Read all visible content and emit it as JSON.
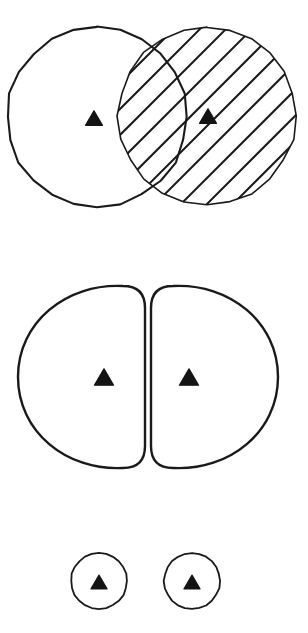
{
  "figure": {
    "background_color": "#ffffff",
    "stroke_color": "#1a1a1a",
    "fill_color": "#ffffff",
    "marker_color": "#141414",
    "width": 308,
    "height": 633,
    "panels": [
      {
        "id": "panel-overlapping-circles",
        "label": "Overlapping circles with hatched right circle",
        "shapes": [
          {
            "name": "left-circle",
            "type": "circle",
            "cx": 97,
            "cy": 117,
            "r": 90,
            "fill": "none",
            "hatched": false,
            "stroke_width": 2.1
          },
          {
            "name": "right-circle",
            "type": "circle",
            "cx": 207,
            "cy": 116,
            "r": 89,
            "fill": "none",
            "hatched": true,
            "hatch_angle_deg": 45,
            "hatch_spacing": 26,
            "hatch_stroke_width": 2.0,
            "stroke_width": 1.6
          }
        ],
        "markers": [
          {
            "name": "left-triangle-marker",
            "type": "triangle-up",
            "cx": 94,
            "cy": 118,
            "size": 17
          },
          {
            "name": "right-triangle-marker",
            "type": "triangle-up",
            "cx": 208,
            "cy": 116,
            "size": 17
          }
        ]
      },
      {
        "id": "panel-split-halves",
        "label": "Two D-shaped halves separated by a gap",
        "shapes": [
          {
            "name": "left-half-shape",
            "type": "d-shape-left",
            "x": 18,
            "y": 286,
            "width": 127,
            "height": 182,
            "flat_side": "right",
            "corner_radius": 22,
            "stroke_width": 2.4
          },
          {
            "name": "right-half-shape",
            "type": "d-shape-right",
            "x": 151,
            "y": 286,
            "width": 127,
            "height": 182,
            "flat_side": "left",
            "corner_radius": 22,
            "stroke_width": 2.4
          }
        ],
        "markers": [
          {
            "name": "left-half-triangle-marker",
            "type": "triangle-up",
            "cx": 104,
            "cy": 377,
            "size": 19
          },
          {
            "name": "right-half-triangle-marker",
            "type": "triangle-up",
            "cx": 189,
            "cy": 377,
            "size": 19
          }
        ]
      },
      {
        "id": "panel-small-circles",
        "label": "Two separate small circles",
        "shapes": [
          {
            "name": "small-left-circle",
            "type": "circle",
            "cx": 99,
            "cy": 581,
            "r": 28,
            "fill": "none",
            "hatched": false,
            "stroke_width": 1.8
          },
          {
            "name": "small-right-circle",
            "type": "circle",
            "cx": 192,
            "cy": 581,
            "r": 28,
            "fill": "none",
            "hatched": false,
            "stroke_width": 1.8
          }
        ],
        "markers": [
          {
            "name": "small-left-triangle-marker",
            "type": "triangle-up",
            "cx": 99,
            "cy": 582,
            "size": 16
          },
          {
            "name": "small-right-triangle-marker",
            "type": "triangle-up",
            "cx": 192,
            "cy": 582,
            "size": 16
          }
        ]
      }
    ]
  }
}
